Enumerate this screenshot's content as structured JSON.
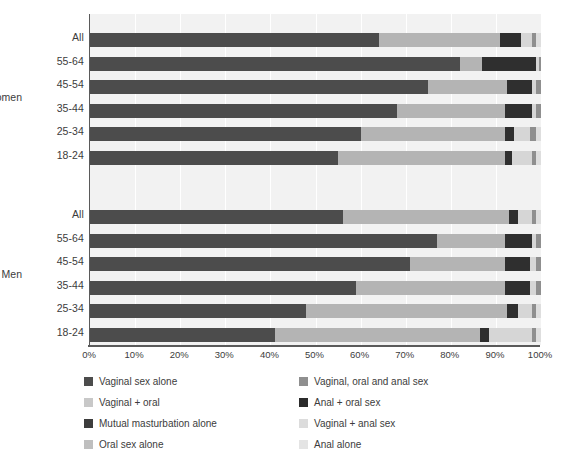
{
  "chart_data": {
    "type": "bar",
    "orientation": "horizontal",
    "stacked": true,
    "stack_mode": "percent",
    "title": "",
    "subtitle": "",
    "xlabel": "",
    "ylabel": "",
    "xlim": [
      0,
      100
    ],
    "xticks": [
      "0%",
      "10%",
      "20%",
      "30%",
      "40%",
      "50%",
      "60%",
      "70%",
      "80%",
      "90%",
      "100%"
    ],
    "xtick_values": [
      0,
      10,
      20,
      30,
      40,
      50,
      60,
      70,
      80,
      90,
      100
    ],
    "grid": true,
    "grid_axis": "x",
    "legend_position": "bottom",
    "legend_columns": 2,
    "group_labels": [
      "Women",
      "Men"
    ],
    "categories": [
      "All",
      "55-64",
      "45-54",
      "35-44",
      "25-34",
      "18-24"
    ],
    "series": [
      {
        "name": "Vaginal sex alone",
        "color": "#4c4c4c"
      },
      {
        "name": "Vaginal, oral and anal sex",
        "color": "#a8a8a8"
      },
      {
        "name": "Vaginal + oral",
        "color": "#cfcfcf"
      },
      {
        "name": "Anal + oral sex",
        "color": "#2b2b2b"
      },
      {
        "name": "Mutual masturbation alone",
        "color": "#3a3a3a"
      },
      {
        "name": "Vaginal + anal sex",
        "color": "#dcdcdc"
      },
      {
        "name": "Oral sex alone",
        "color": "#bdbdbd"
      },
      {
        "name": "Anal alone",
        "color": "#e2e2e2"
      }
    ],
    "groups": [
      {
        "label": "Women",
        "bars": [
          {
            "category": "All",
            "values": [
              64.0,
              27.0,
              4.5,
              2.5,
              1.0,
              1.0
            ]
          },
          {
            "category": "55-64",
            "values": [
              82.0,
              5.0,
              12.0,
              0.5,
              0.5,
              0.0
            ]
          },
          {
            "category": "45-54",
            "values": [
              75.0,
              17.5,
              5.5,
              1.0,
              1.0,
              0.0
            ]
          },
          {
            "category": "35-44",
            "values": [
              68.0,
              24.0,
              6.0,
              1.0,
              1.0,
              0.0
            ]
          },
          {
            "category": "25-34",
            "values": [
              60.0,
              32.0,
              2.0,
              3.5,
              1.5,
              1.0
            ]
          },
          {
            "category": "18-24",
            "values": [
              55.0,
              37.0,
              1.5,
              4.5,
              1.0,
              1.0
            ]
          }
        ]
      },
      {
        "label": "Men",
        "bars": [
          {
            "category": "All",
            "values": [
              56.0,
              37.0,
              2.0,
              3.0,
              1.0,
              1.0
            ]
          },
          {
            "category": "55-64",
            "values": [
              77.0,
              15.0,
              6.0,
              1.0,
              1.0,
              0.0
            ]
          },
          {
            "category": "45-54",
            "values": [
              71.0,
              21.0,
              5.5,
              1.5,
              1.0,
              0.0
            ]
          },
          {
            "category": "35-44",
            "values": [
              59.0,
              33.0,
              5.5,
              1.5,
              1.0,
              0.0
            ]
          },
          {
            "category": "25-34",
            "values": [
              48.0,
              44.5,
              2.5,
              3.0,
              1.0,
              1.0
            ]
          },
          {
            "category": "18-24",
            "values": [
              41.0,
              45.5,
              2.0,
              9.5,
              1.0,
              1.0
            ]
          }
        ]
      }
    ],
    "segment_colors": [
      "#4c4c4c",
      "#b4b4b4",
      "#2f2f2f",
      "#d6d6d6",
      "#8f8f8f",
      "#dedede"
    ],
    "background_color": "#f2f2f2",
    "axis_color": "#5a5a5a",
    "text_color": "#3c3c3c"
  },
  "legend": {
    "items": [
      {
        "label": "Vaginal sex alone",
        "color": "#4c4c4c"
      },
      {
        "label": "Vaginal, oral and anal sex",
        "color": "#8f8f8f"
      },
      {
        "label": "Vaginal + oral",
        "color": "#c8c8c8"
      },
      {
        "label": "Anal + oral sex",
        "color": "#2b2b2b"
      },
      {
        "label": "Mutual masturbation alone",
        "color": "#3d3d3d"
      },
      {
        "label": "Vaginal + anal sex",
        "color": "#dcdcdc"
      },
      {
        "label": "Oral sex alone",
        "color": "#bfbfbf"
      },
      {
        "label": "Anal alone",
        "color": "#e4e4e4"
      }
    ]
  }
}
